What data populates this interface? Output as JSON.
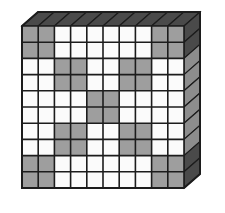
{
  "figure": {
    "type": "grid",
    "rows": 10,
    "cols": 10,
    "projection": "3d-slab",
    "colors": {
      "shaded": "#9e9e9e",
      "empty": "#fbfbfb",
      "grid_line": "#1c1c1c",
      "face_light": "#8d8d8d",
      "face_dark": "#4a4a4a",
      "background": "#ffffff"
    },
    "geometry": {
      "front_x": 22,
      "front_y": 26,
      "cell_w": 16.2,
      "cell_h": 16.2,
      "depth_x": 16,
      "depth_y": 14
    },
    "shaded_cells": [
      [
        1,
        1
      ],
      [
        1,
        2
      ],
      [
        1,
        9
      ],
      [
        1,
        10
      ],
      [
        2,
        1
      ],
      [
        2,
        2
      ],
      [
        2,
        9
      ],
      [
        2,
        10
      ],
      [
        3,
        3
      ],
      [
        3,
        4
      ],
      [
        3,
        7
      ],
      [
        3,
        8
      ],
      [
        4,
        3
      ],
      [
        4,
        4
      ],
      [
        4,
        7
      ],
      [
        4,
        8
      ],
      [
        5,
        5
      ],
      [
        5,
        6
      ],
      [
        6,
        5
      ],
      [
        6,
        6
      ],
      [
        7,
        3
      ],
      [
        7,
        4
      ],
      [
        7,
        7
      ],
      [
        7,
        8
      ],
      [
        8,
        3
      ],
      [
        8,
        4
      ],
      [
        8,
        7
      ],
      [
        8,
        8
      ],
      [
        9,
        1
      ],
      [
        9,
        2
      ],
      [
        9,
        9
      ],
      [
        9,
        10
      ],
      [
        10,
        1
      ],
      [
        10,
        2
      ],
      [
        10,
        9
      ],
      [
        10,
        10
      ]
    ],
    "row_pattern": [
      {
        "row": 1,
        "shaded_columns": [
          1,
          2,
          9,
          10
        ]
      },
      {
        "row": 2,
        "shaded_columns": [
          1,
          2,
          9,
          10
        ]
      },
      {
        "row": 3,
        "shaded_columns": [
          3,
          4,
          7,
          8
        ]
      },
      {
        "row": 4,
        "shaded_columns": [
          3,
          4,
          7,
          8
        ]
      },
      {
        "row": 5,
        "shaded_columns": [
          5,
          6
        ]
      },
      {
        "row": 6,
        "shaded_columns": [
          5,
          6
        ]
      },
      {
        "row": 7,
        "shaded_columns": [
          3,
          4,
          7,
          8
        ]
      },
      {
        "row": 8,
        "shaded_columns": [
          3,
          4,
          7,
          8
        ]
      },
      {
        "row": 9,
        "shaded_columns": [
          1,
          2,
          9,
          10
        ]
      },
      {
        "row": 10,
        "shaded_columns": [
          1,
          2,
          9,
          10
        ]
      }
    ],
    "shaded_count": 36,
    "total_cells": 100
  }
}
